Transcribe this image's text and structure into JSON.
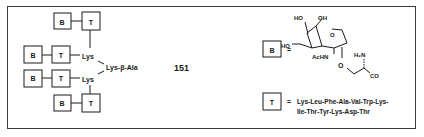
{
  "compound_number": "151",
  "dendrimer": {
    "core": "Lys-β-Ala",
    "branch_upper": "Lys",
    "branch_lower": "Lys",
    "unit_B": "B",
    "unit_T": "T"
  },
  "legend": {
    "B": {
      "box_label": "B",
      "equals": "=",
      "substituents": {
        "ho_top_left": "HO",
        "oh_top_right": "OH",
        "ho_left": "HO",
        "ring_o": "O",
        "achn": "AcHN",
        "glycosidic_o": "O",
        "h2n": "H₂N",
        "co": "CO"
      }
    },
    "T": {
      "box_label": "T",
      "equals": "=",
      "sequence_line1": "Lys-Leu-Phe-Ala-Val-Trp-Lys-",
      "sequence_line2": "Ile-Thr-Tyr-Lys-Asp-Thr"
    }
  },
  "colors": {
    "ink": "#1a1a1a",
    "frame": "#3a3a3a",
    "background": "#ffffff"
  }
}
